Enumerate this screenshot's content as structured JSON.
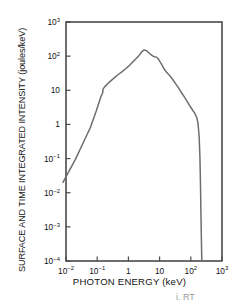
{
  "figure": {
    "background_color": "#ffffff",
    "frame_color": "#4a4a4a",
    "curve_color": "#6e6e6e",
    "stray_text": "i. RT"
  },
  "chart_data": {
    "type": "line",
    "title": "",
    "xlabel": "PHOTON ENERGY (keV)",
    "ylabel": "SURFACE AND TIME INTEGRATED INTENSITY (joules/keV)",
    "xscale": "log",
    "yscale": "log",
    "xlim": [
      0.01,
      1000
    ],
    "ylim": [
      0.0001,
      1000
    ],
    "grid": false,
    "legend": null,
    "xticks": [
      0.01,
      0.1,
      1,
      10,
      100,
      1000
    ],
    "xtick_labels": [
      "10^-2",
      "10^-1",
      "1",
      "10",
      "10^2",
      "10^3"
    ],
    "yticks": [
      0.0001,
      0.001,
      0.01,
      0.1,
      1,
      10,
      100,
      1000
    ],
    "ytick_labels": [
      "10^-4",
      "10^-3",
      "10^-2",
      "10^-1",
      "1",
      "10",
      "10^2",
      "10^3"
    ],
    "series": [
      {
        "name": "spectrum",
        "x": [
          0.008,
          0.012,
          0.02,
          0.035,
          0.06,
          0.095,
          0.13,
          0.145,
          0.15,
          0.155,
          0.185,
          0.24,
          0.33,
          0.45,
          0.6,
          0.8,
          1.0,
          1.35,
          1.75,
          2.2,
          2.7,
          3.2,
          3.8,
          4.4,
          5.2,
          6.1,
          7.0,
          8.2,
          9.5,
          11.5,
          14.0,
          17.0,
          21.0,
          26.0,
          32.0,
          40.0,
          50.0,
          62.0,
          78.0,
          95.0,
          115.0,
          135.0,
          155.0,
          170.0,
          185.0,
          196.0,
          204.0,
          212.0,
          225.0
        ],
        "y": [
          0.02,
          0.04,
          0.095,
          0.28,
          0.8,
          2.6,
          6.4,
          7.8,
          8.6,
          11.0,
          13.5,
          17.0,
          22.0,
          28.0,
          34.0,
          42.0,
          50.0,
          66.0,
          84.0,
          105.0,
          135.0,
          152.0,
          145.0,
          128.0,
          112.0,
          100.0,
          96.0,
          92.0,
          78.0,
          58.0,
          42.0,
          33.0,
          27.0,
          21.0,
          16.0,
          12.0,
          8.6,
          6.4,
          4.6,
          3.4,
          2.6,
          2.1,
          1.6,
          1.1,
          0.45,
          0.11,
          0.02,
          0.002,
          0.0001
        ]
      }
    ]
  }
}
